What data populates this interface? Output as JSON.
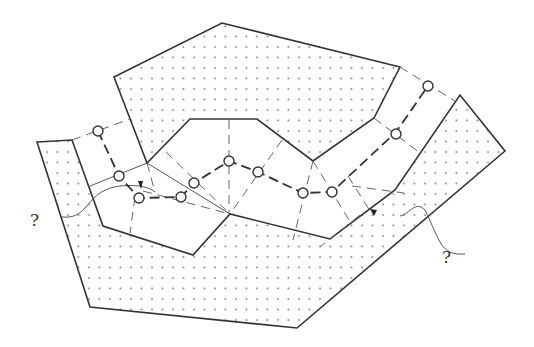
{
  "diagram": {
    "labels": [
      {
        "id": "question-left",
        "text": "?"
      },
      {
        "id": "question-right",
        "text": "?"
      }
    ],
    "colors": {
      "stroke": "#333333",
      "dash": "#555555",
      "dots": "#777777",
      "background": "#ffffff"
    },
    "nodes_count": 12
  }
}
